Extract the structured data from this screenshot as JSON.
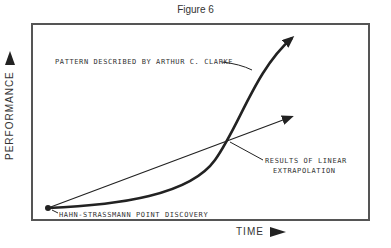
{
  "figure": {
    "title": "Figure 6",
    "y_axis_label": "PERFORMANCE",
    "x_axis_label": "TIME",
    "annotations": {
      "clarke": "PATTERN DESCRIBED BY ARTHUR C. CLARKE",
      "linear_line1": "RESULTS OF LINEAR",
      "linear_line2": "EXTRAPOLATION",
      "origin": "HAHN-STRASSMANN POINT DISCOVERY"
    },
    "colors": {
      "line": "#222222",
      "frame": "#555555"
    }
  }
}
